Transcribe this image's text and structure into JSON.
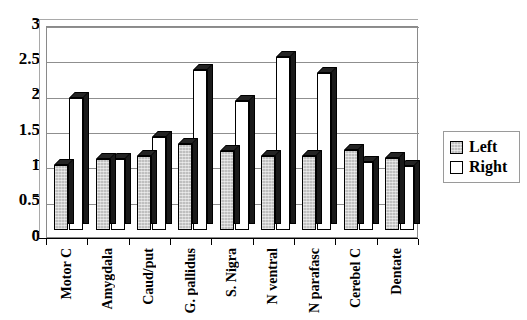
{
  "chart_data": {
    "type": "bar",
    "title": "",
    "xlabel": "",
    "ylabel": "",
    "ylim": [
      0,
      3
    ],
    "ytick_step": 0.5,
    "yticks": [
      "0",
      "0.5",
      "1",
      "1.5",
      "2",
      "2.5",
      "3"
    ],
    "grid": true,
    "legend_position": "right",
    "style": "3d-clustered-column",
    "categories": [
      "Motor C",
      "Amygdala",
      "Caud/put",
      "G. pallidus",
      "S. Nigra",
      "N ventral",
      "N parafasc",
      "Cerebel C",
      "Dentate"
    ],
    "series": [
      {
        "name": "Left",
        "color": "#bfbfbf",
        "values": [
          0.92,
          1.0,
          1.05,
          1.22,
          1.12,
          1.05,
          1.05,
          1.13,
          1.02
        ]
      },
      {
        "name": "Right",
        "color": "#ffffff",
        "values": [
          1.87,
          1.0,
          1.31,
          2.26,
          1.82,
          2.45,
          2.22,
          0.96,
          0.9
        ]
      }
    ]
  },
  "legend": {
    "entries": [
      {
        "label": "Left",
        "swatch": "left"
      },
      {
        "label": "Right",
        "swatch": "right"
      }
    ]
  }
}
